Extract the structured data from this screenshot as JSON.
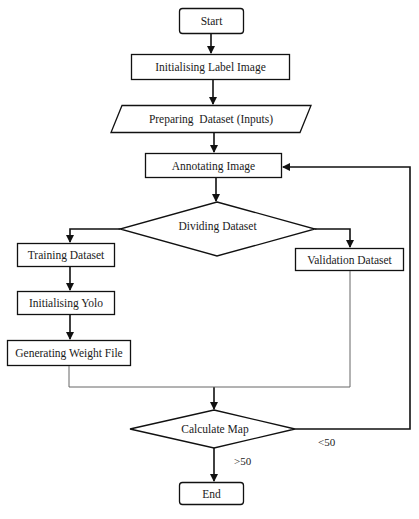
{
  "diagram": {
    "type": "flowchart",
    "nodes": {
      "start": {
        "label": "Start",
        "shape": "rounded-rect"
      },
      "init_label_image": {
        "label": "Initialising Label Image",
        "shape": "rect"
      },
      "preparing_dataset": {
        "label": "Preparing  Dataset (Inputs)",
        "shape": "parallelogram"
      },
      "annotating_image": {
        "label": "Annotating Image",
        "shape": "rect"
      },
      "dividing_dataset": {
        "label": "Dividing Dataset",
        "shape": "diamond"
      },
      "training_dataset": {
        "label": "Training Dataset",
        "shape": "rect"
      },
      "validation_dataset": {
        "label": "Validation Dataset",
        "shape": "rect"
      },
      "initialising_yolo": {
        "label": "Initialising Yolo",
        "shape": "rect"
      },
      "generating_weight_file": {
        "label": "Generating Weight File",
        "shape": "rect"
      },
      "calculate_map": {
        "label": "Calculate Map",
        "shape": "diamond"
      },
      "end": {
        "label": "End",
        "shape": "rounded-rect"
      }
    },
    "edge_labels": {
      "less_than": "<50",
      "greater_than": ">50"
    },
    "edges": [
      {
        "from": "Start",
        "to": "Initialising Label Image"
      },
      {
        "from": "Initialising Label Image",
        "to": "Preparing Dataset (Inputs)"
      },
      {
        "from": "Preparing Dataset (Inputs)",
        "to": "Annotating Image"
      },
      {
        "from": "Annotating Image",
        "to": "Dividing Dataset"
      },
      {
        "from": "Dividing Dataset",
        "to": "Training Dataset"
      },
      {
        "from": "Dividing Dataset",
        "to": "Validation Dataset"
      },
      {
        "from": "Training Dataset",
        "to": "Initialising Yolo"
      },
      {
        "from": "Initialising Yolo",
        "to": "Generating Weight File"
      },
      {
        "from": "Generating Weight File",
        "to": "Calculate Map"
      },
      {
        "from": "Validation Dataset",
        "to": "Calculate Map"
      },
      {
        "from": "Calculate Map",
        "to": "Annotating Image",
        "label": "<50"
      },
      {
        "from": "Calculate Map",
        "to": "End",
        "label": ">50"
      }
    ]
  }
}
